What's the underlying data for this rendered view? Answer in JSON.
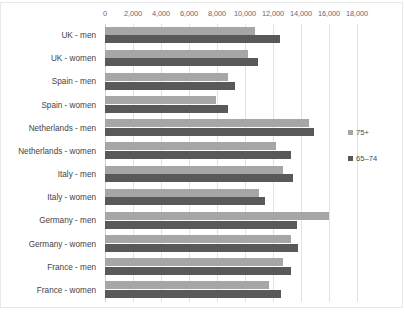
{
  "chart_data": {
    "type": "bar",
    "orientation": "horizontal",
    "title": "",
    "xlabel": "",
    "ylabel": "",
    "xlim": [
      0,
      18000
    ],
    "xticks": [
      "0",
      "2,000",
      "4,000",
      "6,000",
      "8,000",
      "10,000",
      "12,000",
      "14,000",
      "16,000",
      "18,000"
    ],
    "xtick_values": [
      0,
      2000,
      4000,
      6000,
      8000,
      10000,
      12000,
      14000,
      16000,
      18000
    ],
    "grid": true,
    "legend_position": "right",
    "categories": [
      "UK - men",
      "UK - women",
      "Spain - men",
      "Spain - women",
      "Netherlands - men",
      "Netherlands - women",
      "Italy - men",
      "Italy - women",
      "Germany - men",
      "Germany - women",
      "France - men",
      "France - women"
    ],
    "series": [
      {
        "name": "75+",
        "color": "#a6a6a6",
        "values": [
          10700,
          10200,
          8800,
          7900,
          14600,
          12200,
          12700,
          11000,
          16000,
          13300,
          12700,
          11700
        ]
      },
      {
        "name": "65-74",
        "color": "#595959",
        "values": [
          12500,
          10900,
          9300,
          8800,
          14900,
          13300,
          13400,
          11400,
          13700,
          13800,
          13300,
          12600
        ]
      }
    ],
    "legend": [
      {
        "label": "75+",
        "color": "#a6a6a6"
      },
      {
        "label": "65–74",
        "color": "#595959"
      }
    ]
  },
  "colors": {
    "background": "#ffffff",
    "gridline": "#e2e2e2",
    "axis_text": "#6a6a6a",
    "category_text": "#444444",
    "series_75_plus": "#a6a6a6",
    "series_65_74": "#595959"
  }
}
